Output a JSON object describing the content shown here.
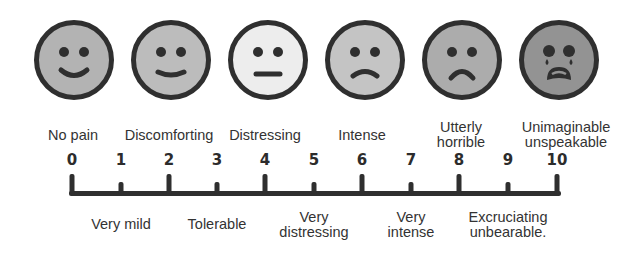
{
  "colors": {
    "outline": "#2f2f2f",
    "face_0": "#b3b3b3",
    "face_2": "#bcbcbc",
    "face_4": "#ededed",
    "face_6": "#c4c4c4",
    "face_8": "#acacac",
    "face_10": "#939393"
  },
  "faces": [
    {
      "level": 0,
      "expression": "smile",
      "icon": "smiling-face-icon"
    },
    {
      "level": 2,
      "expression": "slight-smile",
      "icon": "slight-smile-face-icon"
    },
    {
      "level": 4,
      "expression": "neutral",
      "icon": "neutral-face-icon"
    },
    {
      "level": 6,
      "expression": "slight-frown",
      "icon": "slight-frown-face-icon"
    },
    {
      "level": 8,
      "expression": "frown",
      "icon": "frowning-face-icon"
    },
    {
      "level": 10,
      "expression": "crying",
      "icon": "crying-face-icon"
    }
  ],
  "top_labels": [
    {
      "level": 0,
      "line1": "No pain",
      "line2": ""
    },
    {
      "level": 2,
      "line1": "Discomforting",
      "line2": ""
    },
    {
      "level": 4,
      "line1": "Distressing",
      "line2": ""
    },
    {
      "level": 6,
      "line1": "Intense",
      "line2": ""
    },
    {
      "level": 8,
      "line1": "Utterly",
      "line2": "horrible"
    },
    {
      "level": 10,
      "line1": "Unimaginable",
      "line2": "unspeakable"
    }
  ],
  "scale_numbers": [
    "0",
    "1",
    "2",
    "3",
    "4",
    "5",
    "6",
    "7",
    "8",
    "9",
    "10"
  ],
  "bottom_labels": [
    {
      "level": 1,
      "line1": "Very mild",
      "line2": ""
    },
    {
      "level": 3,
      "line1": "Tolerable",
      "line2": ""
    },
    {
      "level": 5,
      "line1": "Very",
      "line2": "distressing"
    },
    {
      "level": 7,
      "line1": "Very",
      "line2": "intense"
    },
    {
      "level": 9,
      "line1": "Excruciating",
      "line2": "unbearable."
    }
  ]
}
